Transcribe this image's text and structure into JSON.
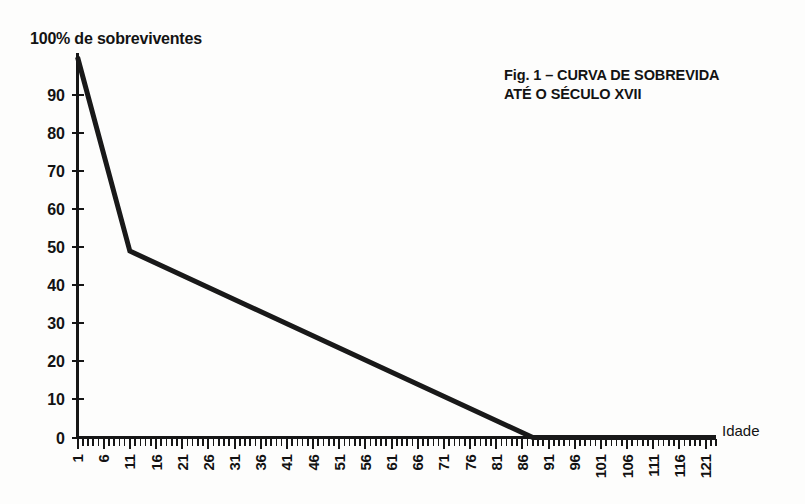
{
  "figure": {
    "caption_line1": "Fig. 1 – CURVA DE SOBREVIDA",
    "caption_line2": "ATÉ O SÉCULO XVII",
    "y_axis_title": "100% de sobreviventes",
    "x_axis_title": "Idade"
  },
  "colors": {
    "ink": "#161616",
    "curve": "#191919",
    "background": "#fdfdfc"
  },
  "chart_data": {
    "type": "line",
    "title": "Fig. 1 – CURVA DE SOBREVIDA ATÉ O SÉCULO XVII",
    "xlabel": "Idade",
    "ylabel": "100% de sobreviventes",
    "xlim": [
      1,
      123
    ],
    "ylim": [
      0,
      100
    ],
    "grid": false,
    "legend": null,
    "y_ticks": [
      0,
      10,
      20,
      30,
      40,
      50,
      60,
      70,
      80,
      90
    ],
    "y_tick_labels": [
      "0",
      "10",
      "20",
      "30",
      "40",
      "50",
      "60",
      "70",
      "80",
      "90"
    ],
    "y_top_label": "100%",
    "x_ticks": [
      1,
      6,
      11,
      16,
      21,
      26,
      31,
      36,
      41,
      46,
      51,
      56,
      61,
      66,
      71,
      76,
      81,
      86,
      91,
      96,
      101,
      106,
      111,
      116,
      121
    ],
    "x_tick_labels": [
      "1",
      "6",
      "11",
      "16",
      "21",
      "26",
      "31",
      "36",
      "41",
      "46",
      "51",
      "56",
      "61",
      "66",
      "71",
      "76",
      "81",
      "86",
      "91",
      "96",
      "101",
      "106",
      "111",
      "116",
      "121"
    ],
    "x_minor_tick_step": 1,
    "series": [
      {
        "name": "Sobreviventes",
        "x": [
          1,
          11,
          88,
          123
        ],
        "values": [
          100,
          49,
          0,
          0
        ]
      }
    ],
    "annotations": [
      "Queda abrupta de 100% para ~49% entre 1 e 11 anos",
      "Declínio linear de ~49% a 0% entre 11 e 88 anos",
      "Zero sobreviventes a partir de ~88 anos"
    ]
  }
}
